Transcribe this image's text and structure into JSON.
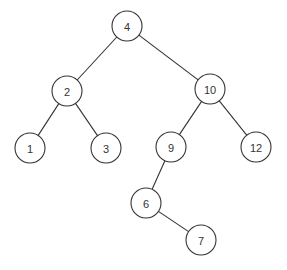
{
  "diagram": {
    "type": "binary-search-tree",
    "node_radius": 15,
    "colors": {
      "stroke": "#333333",
      "fill": "#ffffff",
      "text": "#333333"
    },
    "nodes": [
      {
        "id": "n4",
        "label": "4",
        "x": 127,
        "y": 26
      },
      {
        "id": "n2",
        "label": "2",
        "x": 67,
        "y": 91
      },
      {
        "id": "n10",
        "label": "10",
        "x": 210,
        "y": 89
      },
      {
        "id": "n1",
        "label": "1",
        "x": 30,
        "y": 148
      },
      {
        "id": "n3",
        "label": "3",
        "x": 106,
        "y": 148
      },
      {
        "id": "n9",
        "label": "9",
        "x": 171,
        "y": 147
      },
      {
        "id": "n12",
        "label": "12",
        "x": 256,
        "y": 147
      },
      {
        "id": "n6",
        "label": "6",
        "x": 146,
        "y": 203
      },
      {
        "id": "n7",
        "label": "7",
        "x": 201,
        "y": 240
      }
    ],
    "edges": [
      {
        "from": "n4",
        "to": "n2"
      },
      {
        "from": "n4",
        "to": "n10"
      },
      {
        "from": "n2",
        "to": "n1"
      },
      {
        "from": "n2",
        "to": "n3"
      },
      {
        "from": "n10",
        "to": "n9"
      },
      {
        "from": "n10",
        "to": "n12"
      },
      {
        "from": "n9",
        "to": "n6"
      },
      {
        "from": "n6",
        "to": "n7"
      }
    ]
  }
}
